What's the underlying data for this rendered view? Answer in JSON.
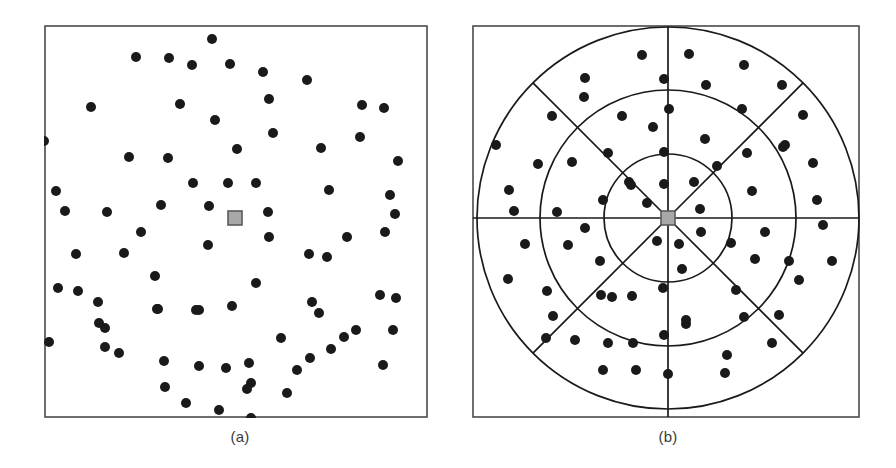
{
  "figure": {
    "caption_a": "(a)",
    "caption_b": "(b)",
    "background_color": "#ffffff",
    "frame_color": "#4a4a4a",
    "dot_color": "#1a1a1a",
    "center_marker_fill": "#a8a8a8",
    "center_marker_stroke": "#5a5a5a",
    "grid_line_color": "#1a1a1a"
  },
  "chart_data": [
    {
      "type": "scatter",
      "panel": "a",
      "title": "(a)",
      "xlabel": "",
      "ylabel": "",
      "grid": false,
      "xlim": [
        0,
        384
      ],
      "ylim": [
        0,
        393
      ],
      "marker": "filled-circle",
      "marker_radius": 5,
      "center_marker": {
        "x": 191,
        "y": 193,
        "size": 14,
        "shape": "square"
      },
      "points": [
        [
          168,
          14
        ],
        [
          125,
          33
        ],
        [
          92,
          32
        ],
        [
          148,
          40
        ],
        [
          219,
          47
        ],
        [
          186,
          39
        ],
        [
          263,
          55
        ],
        [
          -2,
          116
        ],
        [
          47,
          82
        ],
        [
          136,
          79
        ],
        [
          171,
          95
        ],
        [
          225,
          74
        ],
        [
          318,
          80
        ],
        [
          340,
          83
        ],
        [
          124,
          133
        ],
        [
          85,
          132
        ],
        [
          193,
          124
        ],
        [
          229,
          108
        ],
        [
          277,
          123
        ],
        [
          316,
          112
        ],
        [
          354,
          136
        ],
        [
          12,
          166
        ],
        [
          21,
          186
        ],
        [
          63,
          187
        ],
        [
          149,
          158
        ],
        [
          184,
          158
        ],
        [
          212,
          158
        ],
        [
          117,
          180
        ],
        [
          165,
          181
        ],
        [
          224,
          187
        ],
        [
          285,
          165
        ],
        [
          346,
          170
        ],
        [
          351,
          189
        ],
        [
          97,
          207
        ],
        [
          80,
          228
        ],
        [
          164,
          220
        ],
        [
          225,
          212
        ],
        [
          303,
          212
        ],
        [
          341,
          207
        ],
        [
          32,
          229
        ],
        [
          265,
          229
        ],
        [
          34,
          266
        ],
        [
          111,
          251
        ],
        [
          212,
          258
        ],
        [
          283,
          232
        ],
        [
          14,
          263
        ],
        [
          54,
          277
        ],
        [
          113,
          284
        ],
        [
          152,
          285
        ],
        [
          188,
          281
        ],
        [
          268,
          277
        ],
        [
          336,
          270
        ],
        [
          5,
          317
        ],
        [
          55,
          298
        ],
        [
          237,
          313
        ],
        [
          275,
          288
        ],
        [
          312,
          305
        ],
        [
          352,
          273
        ],
        [
          61,
          322
        ],
        [
          114,
          284
        ],
        [
          155,
          285
        ],
        [
          182,
          343
        ],
        [
          61,
          303
        ],
        [
          205,
          338
        ],
        [
          266,
          333
        ],
        [
          300,
          312
        ],
        [
          349,
          305
        ],
        [
          75,
          328
        ],
        [
          120,
          336
        ],
        [
          155,
          341
        ],
        [
          207,
          358
        ],
        [
          253,
          345
        ],
        [
          142,
          378
        ],
        [
          207,
          393
        ],
        [
          175,
          385
        ],
        [
          243,
          368
        ],
        [
          203,
          364
        ],
        [
          121,
          362
        ],
        [
          287,
          324
        ],
        [
          339,
          340
        ]
      ]
    },
    {
      "type": "scatter",
      "panel": "b",
      "title": "(b)",
      "xlabel": "",
      "ylabel": "",
      "grid": true,
      "grid_type": "polar",
      "xlim": [
        0,
        388
      ],
      "ylim": [
        0,
        393
      ],
      "marker": "filled-circle",
      "marker_radius": 5,
      "center": [
        196,
        193
      ],
      "ring_radii": [
        64,
        128,
        191
      ],
      "spoke_count": 8,
      "spoke_angles_deg": [
        0,
        45,
        90,
        135,
        180,
        225,
        270,
        315
      ],
      "diagonal_spoke_inner_radius": 0,
      "diagonal_spoke_outer_radius": 191,
      "axis_spoke_extends_to_frame": true,
      "center_marker": {
        "x": 196,
        "y": 193,
        "size": 14,
        "shape": "square"
      },
      "points": [
        [
          170,
          30
        ],
        [
          217,
          29
        ],
        [
          272,
          40
        ],
        [
          113,
          53
        ],
        [
          112,
          72
        ],
        [
          192,
          54
        ],
        [
          234,
          60
        ],
        [
          310,
          60
        ],
        [
          80,
          91
        ],
        [
          150,
          91
        ],
        [
          331,
          90
        ],
        [
          24,
          120
        ],
        [
          197,
          84
        ],
        [
          270,
          84
        ],
        [
          181,
          102
        ],
        [
          233,
          114
        ],
        [
          100,
          137
        ],
        [
          66,
          139
        ],
        [
          311,
          122
        ],
        [
          275,
          128
        ],
        [
          313,
          120
        ],
        [
          136,
          128
        ],
        [
          192,
          127
        ],
        [
          245,
          141
        ],
        [
          37,
          165
        ],
        [
          341,
          138
        ],
        [
          157,
          157
        ],
        [
          222,
          157
        ],
        [
          159,
          160
        ],
        [
          280,
          166
        ],
        [
          131,
          175
        ],
        [
          192,
          159
        ],
        [
          175,
          178
        ],
        [
          42,
          186
        ],
        [
          345,
          175
        ],
        [
          196,
          193
        ],
        [
          228,
          184
        ],
        [
          85,
          187
        ],
        [
          113,
          203
        ],
        [
          229,
          207
        ],
        [
          293,
          207
        ],
        [
          351,
          200
        ],
        [
          185,
          216
        ],
        [
          207,
          219
        ],
        [
          259,
          218
        ],
        [
          53,
          219
        ],
        [
          96,
          220
        ],
        [
          283,
          234
        ],
        [
          317,
          236
        ],
        [
          360,
          236
        ],
        [
          128,
          236
        ],
        [
          210,
          244
        ],
        [
          36,
          254
        ],
        [
          75,
          266
        ],
        [
          129,
          270
        ],
        [
          191,
          263
        ],
        [
          264,
          265
        ],
        [
          81,
          291
        ],
        [
          140,
          272
        ],
        [
          192,
          310
        ],
        [
          327,
          255
        ],
        [
          160,
          271
        ],
        [
          214,
          299
        ],
        [
          272,
          292
        ],
        [
          307,
          290
        ],
        [
          74,
          313
        ],
        [
          103,
          315
        ],
        [
          214,
          295
        ],
        [
          161,
          318
        ],
        [
          131,
          345
        ],
        [
          253,
          348
        ],
        [
          136,
          318
        ],
        [
          300,
          318
        ],
        [
          196,
          349
        ],
        [
          255,
          330
        ],
        [
          164,
          345
        ]
      ]
    }
  ]
}
